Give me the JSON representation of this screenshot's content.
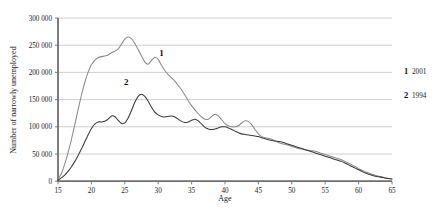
{
  "chart_data": {
    "type": "line",
    "title": "",
    "xlabel": "Age",
    "ylabel": "Number of narrowly unemployed",
    "xlim": [
      15,
      65
    ],
    "ylim": [
      0,
      300000
    ],
    "grid": true,
    "legend_position": "right",
    "x_ticks": [
      "15",
      "20",
      "25",
      "30",
      "35",
      "40",
      "45",
      "50",
      "55",
      "60",
      "65"
    ],
    "y_ticks": [
      "0",
      "50 000",
      "100 000",
      "150 000",
      "200 000",
      "250 000",
      "300 000"
    ],
    "x": [
      15,
      15.5,
      16,
      16.5,
      17,
      17.5,
      18,
      18.5,
      19,
      19.5,
      20,
      20.5,
      21,
      21.5,
      22,
      22.5,
      23,
      23.5,
      24,
      24.5,
      25,
      25.5,
      26,
      26.5,
      27,
      27.5,
      28,
      28.5,
      29,
      29.5,
      30,
      30.5,
      31,
      31.5,
      32,
      32.5,
      33,
      33.5,
      34,
      34.5,
      35,
      35.5,
      36,
      36.5,
      37,
      37.5,
      38,
      38.5,
      39,
      39.5,
      40,
      40.5,
      41,
      41.5,
      42,
      42.5,
      43,
      43.5,
      44,
      44.5,
      45,
      45.5,
      46,
      46.5,
      47,
      47.5,
      48,
      48.5,
      49,
      49.5,
      50,
      50.5,
      51,
      51.5,
      52,
      52.5,
      53,
      53.5,
      54,
      54.5,
      55,
      55.5,
      56,
      56.5,
      57,
      57.5,
      58,
      58.5,
      59,
      59.5,
      60,
      60.5,
      61,
      61.5,
      62,
      62.5,
      63,
      63.5,
      64,
      64.5,
      65
    ],
    "annotations": [
      {
        "label": "1",
        "x": 30.5,
        "y": 231000
      },
      {
        "label": "2",
        "x": 25.2,
        "y": 176000
      }
    ],
    "series": [
      {
        "name": "1",
        "legend_key": "1",
        "legend_label": "2001",
        "color": "#8a8a8a",
        "values": [
          3000,
          14000,
          31000,
          52000,
          76000,
          103000,
          131000,
          158000,
          181000,
          200000,
          214000,
          222000,
          227000,
          229000,
          230000,
          232000,
          236000,
          239000,
          243000,
          252000,
          261000,
          265000,
          262000,
          253000,
          242000,
          230000,
          219000,
          215000,
          222000,
          228000,
          224000,
          213000,
          203000,
          196000,
          190000,
          184000,
          176000,
          168000,
          158000,
          148000,
          139000,
          131000,
          124000,
          118000,
          114000,
          114000,
          119000,
          123000,
          120000,
          113000,
          106000,
          102000,
          100000,
          100000,
          102000,
          107000,
          111000,
          110000,
          104000,
          95000,
          87000,
          82000,
          80000,
          79000,
          77000,
          74000,
          71000,
          69000,
          68000,
          66000,
          64000,
          62000,
          60000,
          59000,
          58000,
          57000,
          56000,
          55000,
          53000,
          51000,
          49000,
          47000,
          45000,
          43000,
          41000,
          39000,
          36000,
          33000,
          30000,
          27000,
          23000,
          20000,
          17000,
          15000,
          13000,
          11000,
          9000,
          8000,
          6000,
          5000,
          4000
        ]
      },
      {
        "name": "2",
        "legend_key": "2",
        "legend_label": "1994",
        "color": "#3a3a3a",
        "values": [
          2000,
          6000,
          11000,
          18000,
          26000,
          36000,
          47000,
          59000,
          72000,
          85000,
          97000,
          105000,
          109000,
          109000,
          110000,
          114000,
          120000,
          119000,
          112000,
          106000,
          107000,
          116000,
          130000,
          145000,
          156000,
          160000,
          156000,
          147000,
          136000,
          127000,
          122000,
          119000,
          118000,
          119000,
          120000,
          118000,
          114000,
          110000,
          108000,
          109000,
          112000,
          114000,
          111000,
          105000,
          99000,
          96000,
          95000,
          96000,
          98000,
          100000,
          100000,
          98000,
          95000,
          92000,
          89000,
          87000,
          86000,
          85000,
          84000,
          83000,
          82000,
          80000,
          78000,
          76000,
          75000,
          74000,
          73000,
          72000,
          70000,
          68000,
          66000,
          64000,
          62000,
          60000,
          58000,
          56000,
          54000,
          52000,
          50000,
          48000,
          46000,
          44000,
          42000,
          40000,
          38000,
          36000,
          33000,
          30000,
          27000,
          24000,
          21000,
          18000,
          15000,
          13000,
          11000,
          9000,
          8000,
          7000,
          6000,
          5000,
          4000
        ]
      }
    ]
  }
}
